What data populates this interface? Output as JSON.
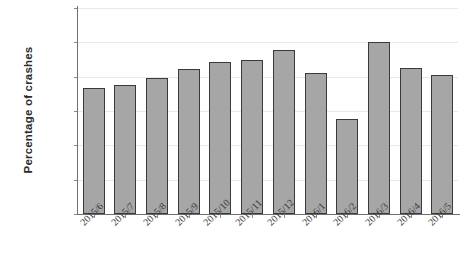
{
  "chart_data": {
    "type": "bar",
    "title": "",
    "xlabel": "",
    "ylabel": "Percentage of crashes",
    "categories": [
      "2015/6",
      "2015/7",
      "2015/8",
      "2015/9",
      "2015/10",
      "2015/11",
      "2015/12",
      "2016/1",
      "2016/2",
      "2016/3",
      "2016/4",
      "2016/5"
    ],
    "values": [
      7.35,
      7.5,
      7.9,
      8.45,
      8.85,
      8.95,
      9.55,
      8.2,
      5.55,
      10.0,
      8.5,
      8.1
    ],
    "value_unit": "percent",
    "ylim": [
      0,
      12
    ],
    "ytick_step": 2,
    "ytick_labels": [
      "0.00%",
      "2.00%",
      "4.00%",
      "6.00%",
      "8.00%",
      "10.00%",
      "12.00%"
    ],
    "ytick_values": [
      0,
      2,
      4,
      6,
      8,
      10,
      12
    ],
    "grid": true,
    "legend": false,
    "legend_position": "none",
    "bar_fill_color": "#a6a6a6",
    "bar_border_color": "#3a3a3a",
    "gridline_color": "#e9e9e9",
    "axis_color": "#6f6f6f"
  }
}
